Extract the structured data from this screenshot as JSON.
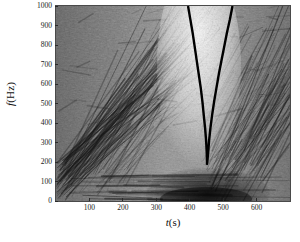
{
  "figure": {
    "type": "spectrogram"
  },
  "axes": {
    "x": {
      "label_variable": "t",
      "label_unit": "(s)",
      "min": 0,
      "max": 700,
      "ticks": [
        100,
        200,
        300,
        400,
        500,
        600
      ],
      "tick_labels": [
        "100",
        "200",
        "300",
        "400",
        "500",
        "600"
      ]
    },
    "y": {
      "label_variable": "f",
      "label_unit": "(Hz)",
      "min": 0,
      "max": 1000,
      "ticks": [
        0,
        100,
        200,
        300,
        400,
        500,
        600,
        700,
        800,
        900,
        1000
      ],
      "tick_labels": [
        "0",
        "100",
        "200",
        "300",
        "400",
        "500",
        "600",
        "700",
        "800",
        "900",
        "1000"
      ]
    }
  },
  "chart_data": {
    "type": "heatmap",
    "title": "",
    "xlabel": "t (s)",
    "ylabel": "f (Hz)",
    "xlim": [
      0,
      700
    ],
    "ylim": [
      0,
      1000
    ],
    "grid": false,
    "legend": "none",
    "colormap": "grayscale-inverted",
    "overlay_curves": [
      {
        "name": "v-shaped-track",
        "color": "#000000",
        "width_px": 2.4,
        "points_t_f": [
          [
            395,
            1000
          ],
          [
            402,
            930
          ],
          [
            409,
            860
          ],
          [
            415,
            790
          ],
          [
            421,
            720
          ],
          [
            427,
            650
          ],
          [
            433,
            580
          ],
          [
            438,
            510
          ],
          [
            442,
            440
          ],
          [
            446,
            375
          ],
          [
            449,
            310
          ],
          [
            451,
            245
          ],
          [
            452,
            190
          ],
          [
            455,
            245
          ],
          [
            458,
            310
          ],
          [
            462,
            375
          ],
          [
            467,
            440
          ],
          [
            473,
            510
          ],
          [
            480,
            580
          ],
          [
            487,
            650
          ],
          [
            495,
            720
          ],
          [
            503,
            790
          ],
          [
            511,
            860
          ],
          [
            520,
            930
          ],
          [
            528,
            1000
          ]
        ]
      }
    ],
    "features": [
      {
        "name": "bright-vertical-band",
        "t_range": [
          330,
          520
        ],
        "f_range": [
          150,
          1000
        ]
      },
      {
        "name": "dark-low-frequency-bands",
        "t_range": [
          380,
          560
        ],
        "f_range": [
          0,
          140
        ]
      },
      {
        "name": "left-diagonal-striations",
        "t_range": [
          0,
          330
        ],
        "f_range": [
          80,
          700
        ]
      },
      {
        "name": "right-diagonal-striations",
        "t_range": [
          520,
          700
        ],
        "f_range": [
          80,
          800
        ]
      }
    ]
  }
}
